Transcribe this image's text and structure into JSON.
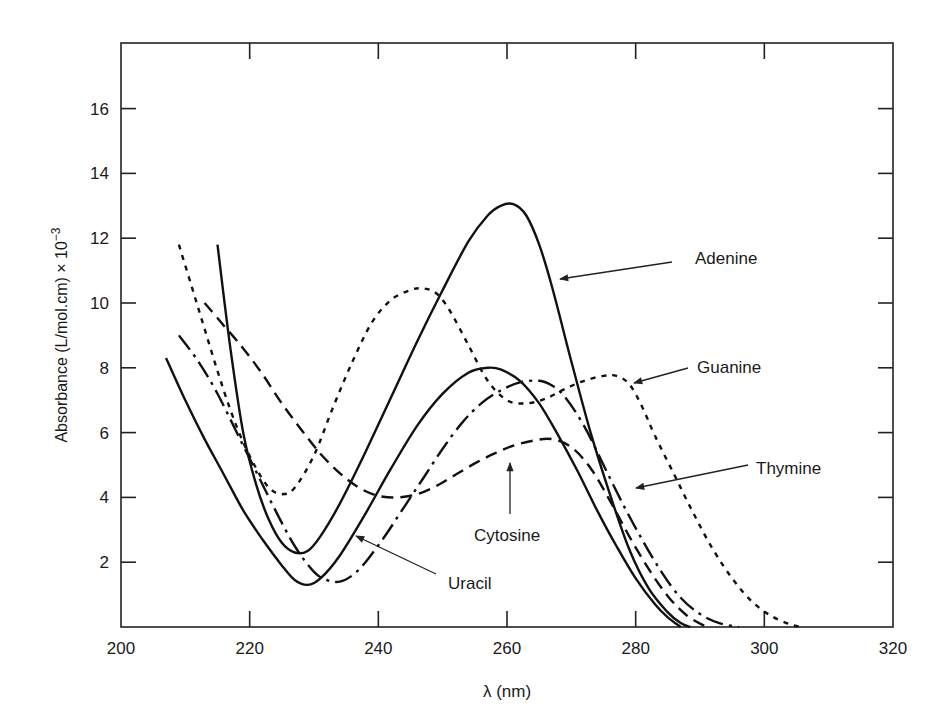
{
  "chart_data": {
    "type": "line",
    "title": "",
    "xlabel": "λ (nm)",
    "ylabel": "Absorbance (L/mol.cm) × 10",
    "ylabel_exponent": "−3",
    "xlim": [
      200,
      320
    ],
    "ylim": [
      0,
      18
    ],
    "xticks": [
      200,
      220,
      240,
      260,
      280,
      300,
      320
    ],
    "yticks": [
      2,
      4,
      6,
      8,
      10,
      12,
      14,
      16
    ],
    "grid": false,
    "legend": "inline annotations with arrows",
    "series": [
      {
        "name": "Adenine",
        "style": "solid",
        "x": [
          215,
          217,
          219,
          221,
          223,
          225,
          227,
          229,
          231,
          234,
          238,
          242,
          246,
          250,
          254,
          257,
          259,
          261,
          263,
          265,
          267,
          270,
          273,
          276,
          279,
          282,
          285,
          287,
          288.5
        ],
        "y": [
          11.8,
          8.6,
          6.0,
          4.4,
          3.3,
          2.6,
          2.3,
          2.35,
          2.8,
          3.8,
          5.4,
          7.1,
          8.8,
          10.4,
          11.9,
          12.7,
          13.0,
          13.05,
          12.7,
          11.8,
          10.5,
          8.2,
          6.0,
          4.1,
          2.4,
          1.2,
          0.45,
          0.12,
          0
        ]
      },
      {
        "name": "Uracil",
        "style": "solid",
        "x": [
          207,
          210,
          213,
          216,
          219,
          222,
          225,
          227,
          229,
          231,
          234,
          238,
          242,
          246,
          250,
          254,
          257,
          259,
          262,
          265,
          268,
          271,
          274,
          277,
          280,
          283,
          285,
          287
        ],
        "y": [
          8.3,
          7.0,
          5.8,
          4.7,
          3.6,
          2.7,
          1.9,
          1.45,
          1.3,
          1.5,
          2.2,
          3.5,
          4.9,
          6.2,
          7.2,
          7.85,
          8.0,
          7.95,
          7.6,
          6.9,
          5.9,
          4.8,
          3.6,
          2.5,
          1.5,
          0.7,
          0.3,
          0
        ]
      },
      {
        "name": "Guanine",
        "style": "dotted",
        "x": [
          209,
          211,
          213,
          215,
          217,
          219,
          221,
          223,
          225,
          227,
          230,
          233,
          236,
          239,
          242,
          245,
          247,
          249,
          251,
          254,
          257,
          260,
          263,
          266,
          269,
          272,
          275,
          277,
          279,
          281,
          283,
          286,
          289,
          292,
          295,
          298,
          301,
          304,
          306
        ],
        "y": [
          11.8,
          10.5,
          9.2,
          7.9,
          6.7,
          5.7,
          4.9,
          4.3,
          4.1,
          4.3,
          5.3,
          6.8,
          8.2,
          9.4,
          10.1,
          10.4,
          10.45,
          10.3,
          9.8,
          8.7,
          7.6,
          7.0,
          6.9,
          7.05,
          7.35,
          7.6,
          7.75,
          7.75,
          7.5,
          6.8,
          5.9,
          4.7,
          3.5,
          2.4,
          1.5,
          0.8,
          0.35,
          0.08,
          0
        ]
      },
      {
        "name": "Thymine",
        "style": "long-dash",
        "x": [
          209,
          212,
          215,
          218,
          221,
          224,
          227,
          230,
          232,
          234,
          236,
          238,
          241,
          244,
          247,
          250,
          253,
          256,
          259,
          262,
          265,
          267,
          269,
          272,
          275,
          278,
          281,
          284,
          287,
          290,
          293,
          296
        ],
        "y": [
          9.0,
          8.2,
          7.2,
          6.0,
          4.8,
          3.6,
          2.5,
          1.7,
          1.45,
          1.4,
          1.6,
          2.0,
          2.8,
          3.7,
          4.6,
          5.5,
          6.3,
          6.9,
          7.3,
          7.55,
          7.6,
          7.45,
          7.1,
          6.2,
          5.0,
          3.8,
          2.7,
          1.7,
          0.9,
          0.4,
          0.12,
          0
        ]
      },
      {
        "name": "Cytosine",
        "style": "dashed",
        "x": [
          213,
          216,
          219,
          222,
          225,
          228,
          231,
          234,
          237,
          240,
          243,
          246,
          249,
          252,
          255,
          258,
          261,
          264,
          267,
          270,
          273,
          276,
          279,
          282,
          285,
          288,
          291
        ],
        "y": [
          10.0,
          9.3,
          8.6,
          7.8,
          6.9,
          6.1,
          5.35,
          4.75,
          4.3,
          4.05,
          4.0,
          4.1,
          4.35,
          4.7,
          5.05,
          5.35,
          5.6,
          5.75,
          5.8,
          5.55,
          4.9,
          3.9,
          2.8,
          1.8,
          0.95,
          0.35,
          0
        ]
      }
    ],
    "annotations": [
      {
        "label": "Adenine",
        "text_xy": [
          695,
          264
        ],
        "arrow_from": [
          672,
          262
        ],
        "arrow_to": [
          560,
          279
        ]
      },
      {
        "label": "Guanine",
        "text_xy": [
          697,
          373
        ],
        "arrow_from": [
          688,
          368
        ],
        "arrow_to": [
          634,
          383
        ]
      },
      {
        "label": "Thymine",
        "text_xy": [
          756,
          474
        ],
        "arrow_from": [
          748,
          465
        ],
        "arrow_to": [
          636,
          488
        ]
      },
      {
        "label": "Cytosine",
        "text_xy": [
          474,
          541
        ],
        "arrow_from": [
          510,
          514
        ],
        "arrow_to": [
          510,
          463
        ]
      },
      {
        "label": "Uracil",
        "text_xy": [
          448,
          589
        ],
        "arrow_from": [
          436,
          574
        ],
        "arrow_to": [
          356,
          536
        ]
      }
    ]
  },
  "axes": {
    "x_title": "λ  (nm)",
    "y_title": "Absorbance (L/mol.cm) × 10",
    "y_title_exp": "−3",
    "x_tick_labels": [
      "200",
      "220",
      "240",
      "260",
      "280",
      "300",
      "320"
    ],
    "y_tick_labels": [
      "2",
      "4",
      "6",
      "8",
      "10",
      "12",
      "14",
      "16"
    ]
  },
  "labels": {
    "adenine": "Adenine",
    "guanine": "Guanine",
    "thymine": "Thymine",
    "cytosine": "Cytosine",
    "uracil": "Uracil"
  }
}
